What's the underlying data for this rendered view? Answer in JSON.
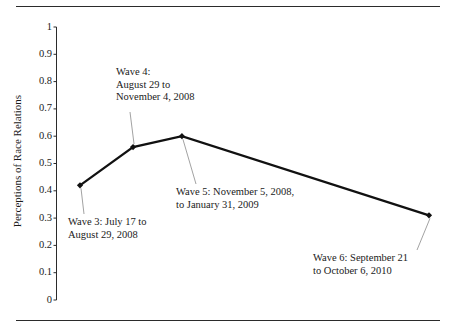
{
  "chart_data": {
    "type": "line",
    "title": "",
    "subtitle": "",
    "xlabel": "",
    "ylabel": "Perceptions of Race Relations",
    "ylim": [
      0,
      1
    ],
    "yticks": [
      "0",
      "0.1",
      "0.2",
      "0.3",
      "0.4",
      "0.5",
      "0.6",
      "0.7",
      "0.8",
      "0.9",
      "1"
    ],
    "ytick_values": [
      0,
      0.1,
      0.2,
      0.3,
      0.4,
      0.5,
      0.6,
      0.7,
      0.8,
      0.9,
      1
    ],
    "xlim": [
      0,
      1
    ],
    "xticks": [],
    "grid": false,
    "legend": false,
    "x_axis_visible": false,
    "categories": [
      "Wave 3",
      "Wave 4",
      "Wave 5",
      "Wave 6"
    ],
    "values": [
      0.42,
      0.56,
      0.6,
      0.31
    ],
    "points": [
      {
        "label": "Wave 3",
        "x": 0.0,
        "y": 0.42
      },
      {
        "label": "Wave 4",
        "x": 0.152,
        "y": 0.56
      },
      {
        "label": "Wave 5",
        "x": 0.292,
        "y": 0.6
      },
      {
        "label": "Wave 6",
        "x": 1.0,
        "y": 0.31
      }
    ],
    "series": [
      {
        "name": "Perceptions of Race Relations",
        "values": [
          0.42,
          0.56,
          0.6,
          0.31
        ],
        "color": "#111111",
        "marker": "diamond",
        "line_width": 2.2
      }
    ],
    "annotations": [
      {
        "name": "wave-3",
        "lines": [
          "Wave 3: July 17 to",
          "August 29, 2008"
        ],
        "target": "Wave 3"
      },
      {
        "name": "wave-4",
        "lines": [
          "Wave 4:",
          "August 29 to",
          "November 4, 2008"
        ],
        "target": "Wave 4"
      },
      {
        "name": "wave-5",
        "lines": [
          "Wave 5: November 5, 2008,",
          "to January 31, 2009"
        ],
        "target": "Wave 5"
      },
      {
        "name": "wave-6",
        "lines": [
          "Wave 6: September 21",
          "to October 6, 2010"
        ],
        "target": "Wave 6"
      }
    ],
    "colors": {
      "line": "#111111",
      "axis": "#2b2b2b",
      "text": "#1a1a1a",
      "leader": "#8a8a8a",
      "rule": "#2b2b2b",
      "background": "#ffffff"
    }
  },
  "axis": {
    "y_title": "Perceptions of Race Relations",
    "ticks": [
      {
        "label": "1",
        "value": 1.0
      },
      {
        "label": "0.9",
        "value": 0.9
      },
      {
        "label": "0.8",
        "value": 0.8
      },
      {
        "label": "0.7",
        "value": 0.7
      },
      {
        "label": "0.6",
        "value": 0.6
      },
      {
        "label": "0.5",
        "value": 0.5
      },
      {
        "label": "0.4",
        "value": 0.4
      },
      {
        "label": "0.3",
        "value": 0.3
      },
      {
        "label": "0.2",
        "value": 0.2
      },
      {
        "label": "0.1",
        "value": 0.1
      },
      {
        "label": "0",
        "value": 0.0
      }
    ]
  },
  "annotations": {
    "wave3": {
      "line1": "Wave 3: July 17 to",
      "line2": "August 29, 2008"
    },
    "wave4": {
      "line1": "Wave 4:",
      "line2": "August 29 to",
      "line3": "November 4, 2008"
    },
    "wave5": {
      "line1": "Wave 5: November 5, 2008,",
      "line2": "to January 31, 2009"
    },
    "wave6": {
      "line1": "Wave 6: September 21",
      "line2": "to October 6, 2010"
    }
  }
}
